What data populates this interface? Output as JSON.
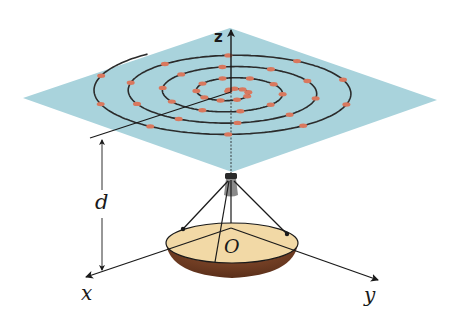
{
  "diagram": {
    "labels": {
      "z_axis": "z",
      "x_axis": "x",
      "y_axis": "y",
      "origin": "O",
      "distance": "d"
    },
    "colors": {
      "plane": "#a9d3dc",
      "spiral": "#2b2b2b",
      "markers": "#d9785e",
      "dish_top": "#f2d9a6",
      "dish_bowl": "#6b3a22",
      "axes": "#1a1a1a"
    },
    "elements": [
      "square plane (viewed obliquely) with spiral path",
      "red marker dots along spiral",
      "radial line from spiral center",
      "feed horn above dish",
      "parabolic dish at origin with three support struts",
      "x, y, z coordinate axes",
      "dimension arrow labelled d"
    ]
  }
}
